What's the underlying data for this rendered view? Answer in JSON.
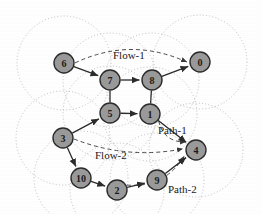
{
  "figure": {
    "width": 262,
    "height": 214,
    "background_color": "#ffffff",
    "node_fill_color": "#9a9a9a",
    "node_stroke_color": "#2b2b2b",
    "range_circle_color": "#b0b0b0",
    "edge_solid_color": "#2b2b2b",
    "edge_dashed_color": "#4a4a4a"
  },
  "nodes": [
    {
      "id": "6",
      "label": "6",
      "cx": 64,
      "cy": 63,
      "r": 10
    },
    {
      "id": "7",
      "label": "7",
      "cx": 110,
      "cy": 80,
      "r": 10
    },
    {
      "id": "8",
      "label": "8",
      "cx": 152,
      "cy": 80,
      "r": 10
    },
    {
      "id": "0",
      "label": "0",
      "cx": 200,
      "cy": 62,
      "r": 10
    },
    {
      "id": "5",
      "label": "5",
      "cx": 110,
      "cy": 113,
      "r": 10
    },
    {
      "id": "1",
      "label": "1",
      "cx": 150,
      "cy": 114,
      "r": 10
    },
    {
      "id": "3",
      "label": "3",
      "cx": 63,
      "cy": 138,
      "r": 10
    },
    {
      "id": "4",
      "label": "4",
      "cx": 196,
      "cy": 150,
      "r": 10
    },
    {
      "id": "10",
      "label": "10",
      "cx": 81,
      "cy": 178,
      "r": 10
    },
    {
      "id": "2",
      "label": "2",
      "cx": 117,
      "cy": 190,
      "r": 10
    },
    {
      "id": "9",
      "label": "9",
      "cx": 157,
      "cy": 180,
      "r": 10
    }
  ],
  "range_circles": [
    {
      "cx": 64,
      "cy": 63,
      "r": 47
    },
    {
      "cx": 110,
      "cy": 80,
      "r": 47
    },
    {
      "cx": 152,
      "cy": 80,
      "r": 47
    },
    {
      "cx": 200,
      "cy": 62,
      "r": 47
    },
    {
      "cx": 110,
      "cy": 113,
      "r": 47
    },
    {
      "cx": 150,
      "cy": 114,
      "r": 47
    },
    {
      "cx": 63,
      "cy": 138,
      "r": 47
    },
    {
      "cx": 196,
      "cy": 150,
      "r": 47
    },
    {
      "cx": 81,
      "cy": 178,
      "r": 47
    },
    {
      "cx": 117,
      "cy": 190,
      "r": 47
    },
    {
      "cx": 157,
      "cy": 180,
      "r": 47
    }
  ],
  "solid_edges": [
    {
      "from": "6",
      "to": "7",
      "arrow": true
    },
    {
      "from": "7",
      "to": "8",
      "arrow": true
    },
    {
      "from": "8",
      "to": "0",
      "arrow": true
    },
    {
      "from": "5",
      "to": "1",
      "arrow": true
    },
    {
      "from": "1",
      "to": "4",
      "arrow": true
    },
    {
      "from": "3",
      "to": "5",
      "arrow": true
    },
    {
      "from": "3",
      "to": "10",
      "arrow": true
    },
    {
      "from": "10",
      "to": "2",
      "arrow": true
    },
    {
      "from": "2",
      "to": "9",
      "arrow": true
    },
    {
      "from": "9",
      "to": "4",
      "arrow": true
    },
    {
      "from": "7",
      "to": "5",
      "arrow": false
    },
    {
      "from": "8",
      "to": "1",
      "arrow": false
    }
  ],
  "dashed_flows": [
    {
      "name": "Flow-1",
      "from": "6",
      "to": "0"
    },
    {
      "name": "Flow-2",
      "from": "3",
      "to": "4"
    },
    {
      "name": "Path-1-dash",
      "from": "1",
      "to": "4"
    },
    {
      "name": "Path-2-dash",
      "from": "2",
      "to": "4"
    }
  ],
  "captions": [
    {
      "id": "flow-1",
      "text": "Flow-1",
      "x": 113,
      "y": 59
    },
    {
      "id": "flow-2",
      "text": "Flow-2",
      "x": 95,
      "y": 159
    },
    {
      "id": "path-1",
      "text": "Path-1",
      "x": 158,
      "y": 134
    },
    {
      "id": "path-2",
      "text": "Path-2",
      "x": 168,
      "y": 193
    }
  ]
}
